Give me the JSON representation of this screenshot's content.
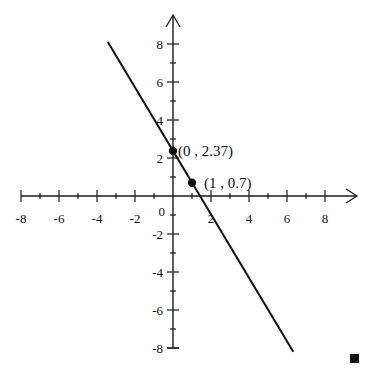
{
  "chart_data": {
    "type": "line",
    "title": "",
    "xlabel": "",
    "ylabel": "",
    "xlim": [
      -8,
      9.5
    ],
    "ylim": [
      -8,
      9.5
    ],
    "grid": false,
    "x_ticks": [
      -8,
      -7,
      -6,
      -5,
      -4,
      -3,
      -2,
      -1,
      1,
      2,
      3,
      4,
      5,
      6,
      7,
      8
    ],
    "y_ticks": [
      -8,
      -7,
      -6,
      -5,
      -4,
      -3,
      -2,
      -1,
      1,
      2,
      3,
      4,
      5,
      6,
      7,
      8
    ],
    "x_tick_labels": [
      {
        "value": -8,
        "label": "-8"
      },
      {
        "value": -6,
        "label": "-6"
      },
      {
        "value": -4,
        "label": "-4"
      },
      {
        "value": -2,
        "label": "-2"
      },
      {
        "value": 2,
        "label": "2"
      },
      {
        "value": 4,
        "label": "4"
      },
      {
        "value": 6,
        "label": "6"
      },
      {
        "value": 8,
        "label": "8"
      }
    ],
    "y_tick_labels": [
      {
        "value": 8,
        "label": "8"
      },
      {
        "value": 6,
        "label": "6"
      },
      {
        "value": 4,
        "label": "4"
      },
      {
        "value": 2,
        "label": "2"
      },
      {
        "value": -2,
        "label": "-2"
      },
      {
        "value": -4,
        "label": "-4"
      },
      {
        "value": -6,
        "label": "-6"
      },
      {
        "value": -8,
        "label": "-8"
      }
    ],
    "origin_label": "0",
    "series": [
      {
        "name": "line",
        "slope": -1.67,
        "intercept": 2.37,
        "x_range": [
          -3.43,
          6.33
        ],
        "points": [
          {
            "x": -3.43,
            "y": 8.1
          },
          {
            "x": 6.33,
            "y": -8.2
          }
        ]
      }
    ],
    "marked_points": [
      {
        "x": 0,
        "y": 2.37,
        "label": "(0 , 2.37)"
      },
      {
        "x": 1,
        "y": 0.7,
        "label": "(1 , 0.7)"
      }
    ],
    "end_marker": "filled-square"
  }
}
